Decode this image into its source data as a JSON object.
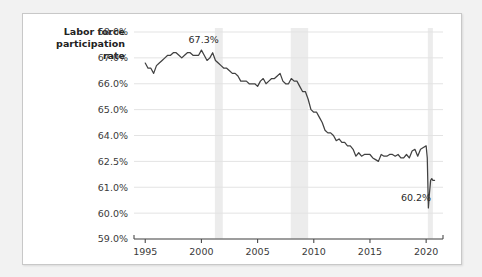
{
  "card": {
    "background": "#ffffff",
    "border_color": "#c8c8c8"
  },
  "page": {
    "background": "#f2f2f2"
  },
  "axis_title": "Labor force\nparticipation\nrate",
  "chart_data": {
    "type": "line",
    "title": "",
    "xlabel": "",
    "ylabel": "Labor force participation rate",
    "grid": true,
    "legend": "none",
    "line_color": "#414141",
    "band_color": "#ececec",
    "xlim": [
      1994.0,
      2021.5
    ],
    "xticks": [
      1995,
      2000,
      2005,
      2010,
      2015,
      2020
    ],
    "xtick_labels": [
      "1995",
      "2000",
      "2005",
      "2010",
      "2015",
      "2020"
    ],
    "ytick_labels": [
      "68.0%",
      "67.0%",
      "66.0%",
      "65.0%",
      "64.0%",
      "62.5%",
      "61.0%",
      "60.0%",
      "59.0%"
    ],
    "ytick_values": [
      68.0,
      67.0,
      66.0,
      65.0,
      64.0,
      62.5,
      61.0,
      60.0,
      59.0
    ],
    "y_axis_note": "non-uniform tick spacing; gridlines evenly spaced",
    "annotations": [
      {
        "label": "67.3%",
        "x": 2000.2,
        "y": 67.3
      },
      {
        "label": "60.2%",
        "x": 2019.1,
        "y": 60.2
      }
    ],
    "shaded_bands": [
      {
        "name": "recession-2001",
        "x0": 2001.2,
        "x1": 2001.9
      },
      {
        "name": "recession-2008",
        "x0": 2007.95,
        "x1": 2009.5
      },
      {
        "name": "recession-2020",
        "x0": 2020.15,
        "x1": 2020.6
      }
    ],
    "x": [
      1995.0,
      1995.25,
      1995.5,
      1995.75,
      1996.0,
      1996.25,
      1996.5,
      1996.75,
      1997.0,
      1997.25,
      1997.5,
      1997.75,
      1998.0,
      1998.25,
      1998.5,
      1998.75,
      1999.0,
      1999.25,
      1999.5,
      1999.75,
      2000.0,
      2000.25,
      2000.5,
      2000.75,
      2001.0,
      2001.25,
      2001.5,
      2001.75,
      2002.0,
      2002.25,
      2002.5,
      2002.75,
      2003.0,
      2003.25,
      2003.5,
      2003.75,
      2004.0,
      2004.25,
      2004.5,
      2004.75,
      2005.0,
      2005.25,
      2005.5,
      2005.75,
      2006.0,
      2006.25,
      2006.5,
      2006.75,
      2007.0,
      2007.25,
      2007.5,
      2007.75,
      2008.0,
      2008.25,
      2008.5,
      2008.75,
      2009.0,
      2009.25,
      2009.5,
      2009.75,
      2010.0,
      2010.25,
      2010.5,
      2010.75,
      2011.0,
      2011.25,
      2011.5,
      2011.75,
      2012.0,
      2012.25,
      2012.5,
      2012.75,
      2013.0,
      2013.25,
      2013.5,
      2013.75,
      2014.0,
      2014.25,
      2014.5,
      2014.75,
      2015.0,
      2015.25,
      2015.5,
      2015.75,
      2016.0,
      2016.25,
      2016.5,
      2016.75,
      2017.0,
      2017.25,
      2017.5,
      2017.75,
      2018.0,
      2018.25,
      2018.5,
      2018.75,
      2019.0,
      2019.25,
      2019.5,
      2019.75,
      2020.0,
      2020.1,
      2020.2,
      2020.3,
      2020.4,
      2020.5,
      2020.6,
      2020.75
    ],
    "values": [
      66.8,
      66.6,
      66.6,
      66.4,
      66.7,
      66.8,
      66.9,
      67.0,
      67.1,
      67.1,
      67.2,
      67.2,
      67.1,
      67.0,
      67.1,
      67.2,
      67.2,
      67.1,
      67.1,
      67.1,
      67.3,
      67.1,
      66.9,
      67.0,
      67.2,
      66.9,
      66.8,
      66.7,
      66.6,
      66.6,
      66.5,
      66.4,
      66.4,
      66.3,
      66.1,
      66.1,
      66.1,
      66.0,
      66.0,
      66.0,
      65.9,
      66.1,
      66.2,
      66.0,
      66.1,
      66.2,
      66.2,
      66.3,
      66.4,
      66.1,
      66.0,
      66.0,
      66.2,
      66.1,
      66.1,
      65.9,
      65.7,
      65.7,
      65.4,
      65.0,
      64.9,
      64.9,
      64.7,
      64.5,
      64.2,
      64.1,
      64.1,
      64.0,
      63.7,
      63.8,
      63.6,
      63.6,
      63.4,
      63.4,
      63.2,
      62.8,
      63.0,
      62.8,
      62.9,
      62.9,
      62.9,
      62.7,
      62.6,
      62.5,
      62.9,
      62.8,
      62.8,
      62.9,
      62.9,
      62.8,
      62.9,
      62.7,
      62.7,
      62.9,
      62.7,
      63.1,
      63.2,
      62.8,
      63.2,
      63.3,
      63.4,
      62.7,
      60.2,
      60.8,
      61.4,
      61.5,
      61.4,
      61.4
    ],
    "source_note": ""
  }
}
